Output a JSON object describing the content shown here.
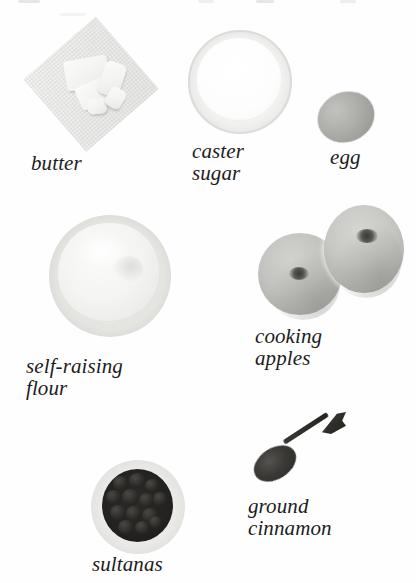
{
  "page": {
    "background_color": "#fefefe",
    "text_color": "#1c1c1c",
    "width": 416,
    "height": 583
  },
  "ingredients": [
    {
      "id": "butter",
      "label": "butter",
      "icon": "butter-block-on-paper-photo",
      "label_lines": [
        "butter"
      ],
      "color": "#f0f0ee"
    },
    {
      "id": "caster-sugar",
      "label": "caster\nsugar",
      "icon": "bowl-of-caster-sugar-photo",
      "label_lines": [
        "caster",
        "sugar"
      ],
      "color": "#fdfdfd"
    },
    {
      "id": "egg",
      "label": "egg",
      "icon": "egg-photo",
      "label_lines": [
        "egg"
      ],
      "color": "#a9a9a6"
    },
    {
      "id": "self-raising-flour",
      "label": "self-raising\nflour",
      "icon": "bowl-of-flour-photo",
      "label_lines": [
        "self-raising",
        "flour"
      ],
      "color": "#f2f2f0"
    },
    {
      "id": "cooking-apples",
      "label": "cooking\napples",
      "icon": "two-apples-photo",
      "label_lines": [
        "cooking",
        "apples"
      ],
      "color": "#c5c5c1"
    },
    {
      "id": "sultanas",
      "label": "sultanas",
      "icon": "bowl-of-sultanas-photo",
      "label_lines": [
        "sultanas"
      ],
      "color": "#242220"
    },
    {
      "id": "ground-cinnamon",
      "label": "ground\ncinnamon",
      "icon": "spoon-of-ground-cinnamon-photo",
      "label_lines": [
        "ground",
        "cinnamon"
      ],
      "color": "#2e2c29"
    }
  ]
}
